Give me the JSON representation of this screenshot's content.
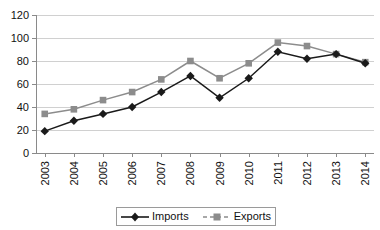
{
  "chart_data": {
    "type": "line",
    "title": "",
    "xlabel": "",
    "ylabel": "",
    "categories": [
      "2003",
      "2004",
      "2005",
      "2006",
      "2007",
      "2008",
      "2009",
      "2010",
      "2011",
      "2012",
      "2013",
      "2014"
    ],
    "series": [
      {
        "name": "Imports",
        "color": "#1a1a1a",
        "marker": "diamond",
        "values": [
          19,
          28,
          34,
          40,
          53,
          67,
          48,
          65,
          88,
          82,
          86,
          78
        ]
      },
      {
        "name": "Exports",
        "color": "#8c8c8c",
        "marker": "square",
        "values": [
          34,
          38,
          46,
          53,
          64,
          80,
          65,
          78,
          96,
          93,
          86,
          79
        ]
      }
    ],
    "ylim": [
      0,
      120
    ],
    "yticks": [
      0,
      20,
      40,
      60,
      80,
      100,
      120
    ],
    "ytick_labels": [
      "0",
      "20",
      "40",
      "60",
      "80",
      "100",
      "120"
    ],
    "grid": true,
    "grid_axis": "y",
    "legend_position": "bottom",
    "legend_entries": [
      "Imports",
      "Exports"
    ],
    "xtick_rotation": 90
  },
  "legend": {
    "imports_label": "Imports",
    "exports_label": "Exports"
  },
  "colors": {
    "imports": "#1a1a1a",
    "exports": "#8c8c8c",
    "gridline": "#d0d0d0",
    "axis": "#8a8a8a",
    "background": "#ffffff"
  }
}
